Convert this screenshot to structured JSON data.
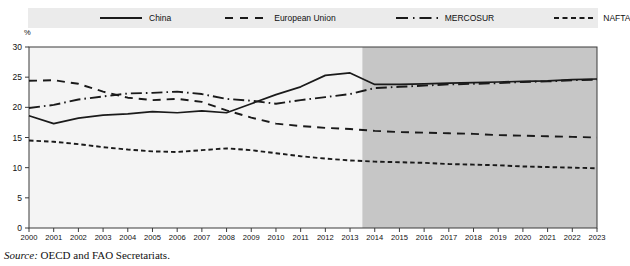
{
  "figure": {
    "axis_unit_label": "%",
    "source_label": "Source:",
    "source_text": "OECD and FAO Secretariats.",
    "plot_bg": "#f4f4f4",
    "projection_bg": "#c6c6c6",
    "legend_bg": "#ebebeb",
    "line_color": "#1a1a1a"
  },
  "legend": {
    "items": [
      {
        "label": "China",
        "style": "solid",
        "icon": "solid-line-icon"
      },
      {
        "label": "European Union",
        "style": "dashed",
        "icon": "dashed-line-icon"
      },
      {
        "label": "MERCOSUR",
        "style": "dash-dot",
        "icon": "dash-dot-line-icon"
      },
      {
        "label": "NAFTA",
        "style": "short-dash",
        "icon": "short-dash-line-icon"
      }
    ]
  },
  "chart_data": {
    "type": "line",
    "title": "",
    "xlabel": "",
    "ylabel": "%",
    "ylim": [
      0,
      30
    ],
    "yticks": [
      0,
      5,
      10,
      15,
      20,
      25,
      30
    ],
    "xlim": [
      2000,
      2023
    ],
    "grid": false,
    "legend_position": "top",
    "projection_start": 2013.5,
    "projection_note": "shaded area denotes projection period",
    "x": [
      2000,
      2001,
      2002,
      2003,
      2004,
      2005,
      2006,
      2007,
      2008,
      2009,
      2010,
      2011,
      2012,
      2013,
      2014,
      2015,
      2016,
      2017,
      2018,
      2019,
      2020,
      2021,
      2022,
      2023
    ],
    "categories": [
      "2000",
      "2001",
      "2002",
      "2003",
      "2004",
      "2005",
      "2006",
      "2007",
      "2008",
      "2009",
      "2010",
      "2011",
      "2012",
      "2013",
      "2014",
      "2015",
      "2016",
      "2017",
      "2018",
      "2019",
      "2020",
      "2021",
      "2022",
      "2023"
    ],
    "series": [
      {
        "name": "China",
        "style": "solid",
        "values": [
          18.6,
          17.3,
          18.2,
          18.7,
          18.9,
          19.3,
          19.1,
          19.4,
          19.1,
          20.6,
          22.1,
          23.4,
          25.3,
          25.7,
          23.8,
          23.8,
          23.9,
          24.0,
          24.1,
          24.2,
          24.3,
          24.4,
          24.6,
          24.7
        ]
      },
      {
        "name": "European Union",
        "style": "dashed",
        "values": [
          24.4,
          24.5,
          23.9,
          22.6,
          21.6,
          21.2,
          21.4,
          20.9,
          19.5,
          18.3,
          17.3,
          16.9,
          16.6,
          16.4,
          16.1,
          15.9,
          15.8,
          15.7,
          15.6,
          15.4,
          15.3,
          15.2,
          15.1,
          15.0
        ]
      },
      {
        "name": "MERCOSUR",
        "style": "dash-dot",
        "values": [
          19.9,
          20.4,
          21.3,
          21.8,
          22.3,
          22.4,
          22.6,
          22.2,
          21.4,
          21.1,
          20.6,
          21.2,
          21.7,
          22.2,
          23.2,
          23.4,
          23.6,
          23.8,
          23.9,
          24.0,
          24.2,
          24.3,
          24.5,
          24.6
        ]
      },
      {
        "name": "NAFTA",
        "style": "short-dash",
        "values": [
          14.5,
          14.3,
          13.9,
          13.4,
          13.0,
          12.7,
          12.6,
          12.9,
          13.2,
          12.9,
          12.4,
          11.9,
          11.5,
          11.2,
          11.0,
          10.9,
          10.8,
          10.6,
          10.5,
          10.4,
          10.2,
          10.1,
          10.0,
          9.9
        ]
      }
    ]
  }
}
